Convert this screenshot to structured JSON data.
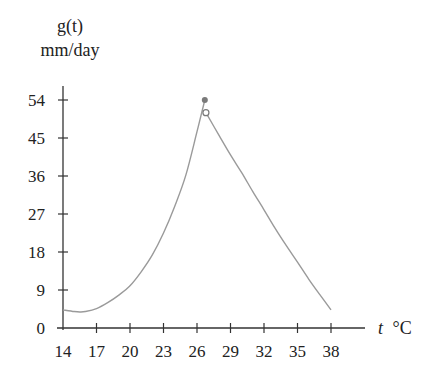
{
  "chart_data": {
    "type": "line",
    "title": "",
    "ylabel": "g(t)",
    "ylabel_units": "mm/day",
    "xlabel": "t",
    "xlabel_units": "°C",
    "xlim": [
      14,
      38
    ],
    "ylim": [
      0,
      54
    ],
    "x_ticks": [
      14,
      17,
      20,
      23,
      26,
      29,
      32,
      35,
      38
    ],
    "y_ticks": [
      0,
      9,
      18,
      27,
      36,
      45,
      54
    ],
    "grid": false,
    "legend": null,
    "series": [
      {
        "name": "g(t) left branch",
        "x": [
          14,
          15,
          15.5,
          16,
          17,
          18,
          19,
          20,
          21,
          22,
          23,
          24,
          25,
          26,
          26.7
        ],
        "values": [
          4.3,
          3.9,
          3.8,
          3.9,
          4.6,
          6.0,
          7.8,
          10.0,
          13.3,
          17.3,
          22.5,
          28.8,
          36.2,
          46.5,
          54
        ]
      },
      {
        "name": "g(t) right branch",
        "x": [
          26.8,
          28,
          29,
          30,
          31,
          32,
          33,
          34,
          35,
          36,
          37,
          38
        ],
        "values": [
          51,
          45.5,
          41,
          36.8,
          32.3,
          28,
          23.6,
          19.5,
          15.6,
          11.6,
          7.9,
          4.3
        ]
      }
    ],
    "markers": [
      {
        "type": "filled",
        "x": 26.7,
        "y": 54
      },
      {
        "type": "open",
        "x": 26.8,
        "y": 51
      }
    ],
    "colors": {
      "curve": "#9a9a9a",
      "axis": "#333333",
      "filled_marker": "#7a7a7a",
      "text": "#222222"
    }
  }
}
